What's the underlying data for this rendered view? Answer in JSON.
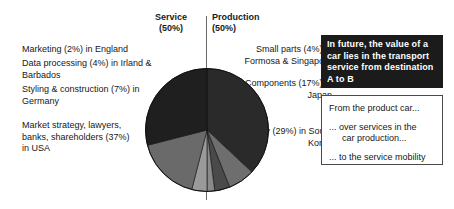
{
  "headers": {
    "service": {
      "title": "Service",
      "percent": "(50%)"
    },
    "production": {
      "title": "Production",
      "percent": "(50%)"
    }
  },
  "left_labels": [
    {
      "name": "marketing",
      "text": "Marketing (2%) in England"
    },
    {
      "name": "data-processing",
      "text": "Data processing (4%) in Irland & Barbados"
    },
    {
      "name": "styling-construction",
      "text": "Styling & construction (7%) in Germany"
    },
    {
      "name": "market-strategy",
      "text": "Market strategy, lawyers, banks, shareholders (37%) in USA"
    }
  ],
  "right_labels": [
    {
      "name": "small-parts",
      "text": "Small parts (4%) in Formosa & Singapore"
    },
    {
      "name": "components",
      "text": "Components (17%) in Japan"
    },
    {
      "name": "assembly",
      "text": "Assembly (29%) in South Korea"
    }
  ],
  "callout": {
    "text": "In future, the value of a car lies in the transport service from destination A to B",
    "background": "#1b1b1b",
    "color": "#ffffff"
  },
  "steps": [
    {
      "name": "step-product-car",
      "text": "From the product car...",
      "indented": false
    },
    {
      "name": "step-services-production",
      "lead": "... over services in the",
      "text": "car production...",
      "indented": true
    },
    {
      "name": "step-service-mobility",
      "text": "... to the service mobility",
      "indented": false
    }
  ],
  "chart_data": {
    "type": "pie",
    "legend_position": "outside-callouts",
    "labels": [
      "Market strategy, lawyers, banks, shareholders (37%) in USA",
      "Styling & construction (7%) in Germany",
      "Data processing (4%) in Irland & Barbados",
      "Marketing (2%) in England",
      "Small parts (4%) in Formosa & Singapore",
      "Components (17%) in Japan",
      "Assembly (29%) in South Korea"
    ],
    "short_labels": [
      "Market strategy",
      "Styling & construction",
      "Data processing",
      "Marketing",
      "Small parts",
      "Components",
      "Assembly"
    ],
    "values": [
      37,
      7,
      4,
      2,
      4,
      17,
      29
    ],
    "units": "percent",
    "groups": [
      {
        "name": "Service",
        "percent": 50,
        "slices": [
          "Market strategy",
          "Styling & construction",
          "Data processing",
          "Marketing"
        ]
      },
      {
        "name": "Production",
        "percent": 50,
        "slices": [
          "Small parts",
          "Components",
          "Assembly"
        ]
      }
    ],
    "colors": [
      "#2a2a2a",
      "#6e6e6e",
      "#4a4a4a",
      "#8a8a8a",
      "#9a9a9a",
      "#6a6a6a",
      "#1f1f1f"
    ]
  }
}
